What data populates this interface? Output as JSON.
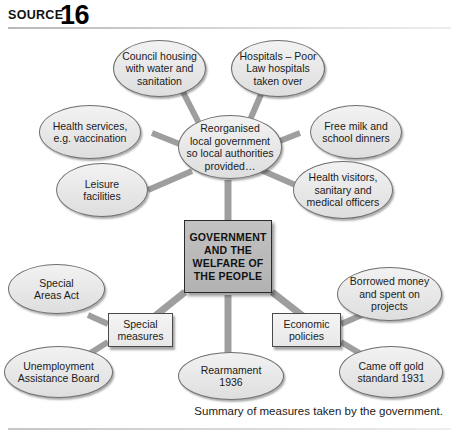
{
  "header": {
    "source_label": "SOURCE",
    "source_number": "16"
  },
  "caption": "Summary of measures taken by the government.",
  "diagram": {
    "type": "concept-map",
    "center": {
      "id": "center",
      "label": "GOVERNMENT\nAND THE\nWELFARE OF\nTHE PEOPLE",
      "shape": "rect"
    },
    "hub": {
      "id": "hub-local-government",
      "label": "Reorganised\nlocal government\nso local authorities\nprovided…",
      "shape": "ellipse"
    },
    "branches": [
      {
        "id": "special-measures",
        "label": "Special\nmeasures",
        "shape": "rect"
      },
      {
        "id": "economic-policies",
        "label": "Economic\npolicies",
        "shape": "rect"
      }
    ],
    "nodes": [
      {
        "id": "council-housing",
        "label": "Council housing\nwith water and\nsanitation",
        "shape": "ellipse",
        "parent": "hub-local-government"
      },
      {
        "id": "hospitals",
        "label": "Hospitals – Poor\nLaw hospitals\ntaken over",
        "shape": "ellipse",
        "parent": "hub-local-government"
      },
      {
        "id": "health-services",
        "label": "Health services,\ne.g. vaccination",
        "shape": "ellipse",
        "parent": "hub-local-government"
      },
      {
        "id": "free-milk",
        "label": "Free milk and\nschool dinners",
        "shape": "ellipse",
        "parent": "hub-local-government"
      },
      {
        "id": "leisure-facilities",
        "label": "Leisure\nfacilities",
        "shape": "ellipse",
        "parent": "hub-local-government"
      },
      {
        "id": "health-visitors",
        "label": "Health visitors,\nsanitary and\nmedical officers",
        "shape": "ellipse",
        "parent": "hub-local-government"
      },
      {
        "id": "special-areas-act",
        "label": "Special\nAreas Act",
        "shape": "ellipse",
        "parent": "special-measures"
      },
      {
        "id": "unemployment-assistance-board",
        "label": "Unemployment\nAssistance Board",
        "shape": "ellipse",
        "parent": "special-measures"
      },
      {
        "id": "rearmament",
        "label": "Rearmament\n1936",
        "shape": "ellipse",
        "parent": "center"
      },
      {
        "id": "borrowed-money",
        "label": "Borrowed money\nand spent on\nprojects",
        "shape": "ellipse",
        "parent": "economic-policies"
      },
      {
        "id": "gold-standard",
        "label": "Came off gold\nstandard 1931",
        "shape": "ellipse",
        "parent": "economic-policies"
      }
    ],
    "colors": {
      "ellipse_fill": "#eaeaea",
      "ellipse_stroke": "#6f6f6f",
      "center_fill": "#b8b8b8",
      "center_stroke": "#2b2b2b",
      "connector": "#a8a8a8",
      "text": "#1b1b1b"
    }
  }
}
